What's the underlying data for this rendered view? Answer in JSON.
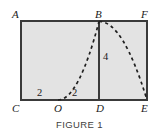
{
  "figure": {
    "caption": "FIGURE 1",
    "type": "geometry-diagram",
    "colors": {
      "fill": "#e3e3e3",
      "stroke": "#3a3a3a",
      "dash": "#1f1f1f",
      "background": "#ffffff",
      "text": "#1a1a1a",
      "caption": "#404040"
    },
    "vertex_labels": [
      {
        "id": "A",
        "text": "A",
        "x": 12,
        "y": 9
      },
      {
        "id": "B",
        "text": "B",
        "x": 95,
        "y": 9
      },
      {
        "id": "F",
        "text": "F",
        "x": 141,
        "y": 9
      },
      {
        "id": "C",
        "text": "C",
        "x": 12,
        "y": 103
      },
      {
        "id": "O",
        "text": "O",
        "x": 54,
        "y": 103
      },
      {
        "id": "D",
        "text": "D",
        "x": 96,
        "y": 103
      },
      {
        "id": "E",
        "text": "E",
        "x": 141,
        "y": 103
      }
    ],
    "measure_labels": [
      {
        "id": "left-two",
        "text": "2",
        "x": 37,
        "y": 88
      },
      {
        "id": "right-two",
        "text": "2",
        "x": 72,
        "y": 88
      },
      {
        "id": "height-four",
        "text": "4",
        "x": 103,
        "y": 52
      }
    ],
    "rectangle": {
      "name": "ACEF",
      "x": 21,
      "y": 21,
      "width": 126,
      "height": 79,
      "stroke_width": 1.6
    },
    "segment_bd": {
      "name": "BD",
      "x1": 99,
      "y1": 21,
      "x2": 99,
      "y2": 100,
      "stroke_width": 1.6,
      "length_label": "4"
    },
    "parabola": {
      "name": "dashed-parabola",
      "vertex": {
        "x": 99,
        "y": 21
      },
      "left_end": {
        "x": 58,
        "y": 100
      },
      "right_end": {
        "x": 147,
        "y": 100
      },
      "dash_pattern": "3.2 3.2",
      "stroke_width": 1.7
    },
    "points": [
      {
        "id": "A",
        "x": 21,
        "y": 21
      },
      {
        "id": "B",
        "x": 99,
        "y": 21
      },
      {
        "id": "F",
        "x": 147,
        "y": 21
      },
      {
        "id": "C",
        "x": 21,
        "y": 100
      },
      {
        "id": "O",
        "x": 58,
        "y": 100
      },
      {
        "id": "D",
        "x": 99,
        "y": 100
      },
      {
        "id": "E",
        "x": 147,
        "y": 100
      }
    ]
  }
}
